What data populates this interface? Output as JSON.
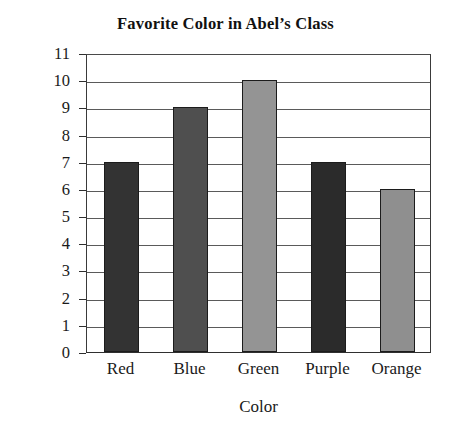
{
  "chart_data": {
    "type": "bar",
    "title": "Favorite Color in Abel’s Class",
    "xlabel": "Color",
    "ylabel": "Number of responses",
    "categories": [
      "Red",
      "Blue",
      "Green",
      "Purple",
      "Orange"
    ],
    "values": [
      7,
      9,
      10,
      7,
      6
    ],
    "ylim": [
      0,
      11
    ],
    "ytick_labels": [
      "0",
      "1",
      "2",
      "3",
      "4",
      "5",
      "6",
      "7",
      "8",
      "9",
      "10",
      "11"
    ],
    "grid": true,
    "legend": "none",
    "bar_colors": [
      "#333333",
      "#4f4f4f",
      "#949494",
      "#2b2b2b",
      "#8f8f8f"
    ],
    "bar_border_color": "#1c1c1c",
    "gridline_color": "#5a5a5a",
    "axis_color": "#2f2f2f",
    "background_color": "#ffffff"
  }
}
